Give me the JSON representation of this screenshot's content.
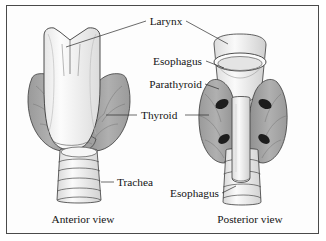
{
  "figure": {
    "frame_color": "#4a4a4a",
    "background": "#fdfdfd"
  },
  "labels": {
    "larynx": "Larynx",
    "esophagus_top": "Esophagus",
    "parathyroid": "Parathyroid",
    "thyroid": "Thyroid",
    "trachea": "Trachea",
    "esophagus_bottom": "Esophagus"
  },
  "captions": {
    "left": "Anterior view",
    "right": "Posterior view"
  },
  "colors": {
    "thyroid_fill": "#a6a6a6",
    "thyroid_shade": "#8f8f8f",
    "larynx_fill": "#fbfbfb",
    "trachea_fill": "#f2f2f2",
    "parathyroid_fill": "#1d1d1d",
    "outline": "#3a3a3a",
    "vessel": "#6e6e6e",
    "text": "#141414"
  },
  "structures": {
    "anterior": {
      "name": "Anterior view specimen",
      "parts": [
        "larynx",
        "thyroid-left-lobe",
        "thyroid-right-lobe",
        "isthmus",
        "trachea"
      ],
      "trachea_rings": 5
    },
    "posterior": {
      "name": "Posterior view specimen",
      "parts": [
        "esophagus-opening",
        "thyroid-left-lobe",
        "thyroid-right-lobe",
        "esophagus",
        "trachea"
      ],
      "parathyroid_glands": 4,
      "trachea_rings": 4
    }
  }
}
